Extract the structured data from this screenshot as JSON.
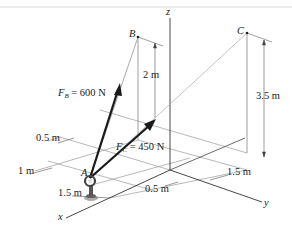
{
  "figure": {
    "axes": {
      "x": "x",
      "y": "y",
      "z": "z"
    },
    "points": {
      "A": "A",
      "B": "B",
      "C": "C"
    },
    "forces": {
      "FB": {
        "symbol": "F",
        "sub": "B",
        "value": " = 600 N"
      },
      "FC": {
        "symbol": "F",
        "sub": "C",
        "value": " = 450 N"
      }
    },
    "dimensions": {
      "B_height": "2 m",
      "C_height": "3.5 m",
      "x_offset_top": "0.5 m",
      "x_offset_1m": "1 m",
      "x_offset_15": "1.5 m",
      "y_offset_05": "0.5 m",
      "y_offset_15": "1.5 m"
    },
    "colors": {
      "line": "#555555",
      "arrow": "#1a1a1a",
      "text": "#222222"
    }
  }
}
